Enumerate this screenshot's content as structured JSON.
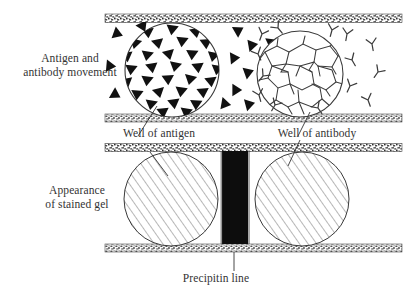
{
  "figure": {
    "title_labels": {
      "movement": "Antigen and\nantibody movement",
      "stained_gel": "Appearance\nof stained gel",
      "well_antigen": "Well of antigen",
      "well_antibody": "Well of antibody",
      "precipitin": "Precipitin line"
    },
    "colors": {
      "background": "#ffffff",
      "text": "#333333",
      "gel_edge_band": "#4a4a4a",
      "precipitin_line": "#0d0d0d",
      "antigen_symbol": "#111111",
      "antibody_symbol": "#3c3c3c",
      "hatch_line": "#555555",
      "circle_outline": "#333333"
    },
    "panels": [
      {
        "name": "movement-panel",
        "description": "Antigen and antibody movement through gel",
        "wells": [
          {
            "name": "antigen-well",
            "symbol": "filled-triangle",
            "symbol_count": 46,
            "cx": 172,
            "cy": 70,
            "r": 48
          },
          {
            "name": "antibody-well",
            "symbol": "y-shape-antibody",
            "symbol_count": 30,
            "cx": 300,
            "cy": 74,
            "r": 44
          }
        ],
        "free_antigen_count": 9,
        "free_antibody_count": 10
      },
      {
        "name": "stained-gel-panel",
        "description": "Appearance of stained gel with precipitin line",
        "wells": [
          {
            "name": "antigen-well-stained",
            "fill": "diagonal-hatch",
            "cx": 171,
            "cy": 199,
            "r": 47
          },
          {
            "name": "antibody-well-stained",
            "fill": "diagonal-hatch",
            "cx": 302,
            "cy": 199,
            "r": 47
          }
        ],
        "precipitin_line": {
          "x": 222,
          "y": 151,
          "width": 26,
          "height": 96
        }
      }
    ]
  }
}
